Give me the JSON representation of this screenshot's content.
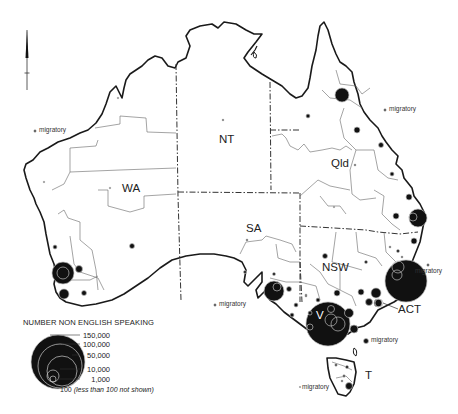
{
  "map": {
    "title": "Number of non English speaking (Australia)",
    "state_labels": [
      {
        "id": "wa",
        "label": "WA",
        "x": 122,
        "y": 183
      },
      {
        "id": "nt",
        "label": "NT",
        "x": 219,
        "y": 134
      },
      {
        "id": "qld",
        "label": "Qld",
        "x": 331,
        "y": 158
      },
      {
        "id": "sa",
        "label": "SA",
        "x": 246,
        "y": 223
      },
      {
        "id": "nsw",
        "label": "NSW",
        "x": 322,
        "y": 265
      },
      {
        "id": "vic",
        "label": "V",
        "x": 318,
        "y": 312
      },
      {
        "id": "act",
        "label": "ACT",
        "x": 398,
        "y": 309
      },
      {
        "id": "tas",
        "label": "T",
        "x": 365,
        "y": 374
      }
    ],
    "migratory_labels": [
      {
        "id": "mig-wa",
        "label": "migratory",
        "x": 38,
        "y": 128
      },
      {
        "id": "mig-qld",
        "label": "migratory",
        "x": 388,
        "y": 107
      },
      {
        "id": "mig-sa",
        "label": "migratory",
        "x": 220,
        "y": 302
      },
      {
        "id": "mig-nsw",
        "label": "migratory",
        "x": 417,
        "y": 266
      },
      {
        "id": "mig-vic",
        "label": "migratory",
        "x": 370,
        "y": 340
      },
      {
        "id": "mig-tas",
        "label": "migratory",
        "x": 302,
        "y": 385
      }
    ],
    "colors": {
      "coast": "#1a1a1a",
      "region_border": "#555555",
      "state_border": "#333333",
      "symbol_fill": "#111111",
      "symbol_ring": "#bbbbbb"
    }
  },
  "legend": {
    "title": "NUMBER NON ENGLISH SPEAKING",
    "values": [
      "150,000",
      "100,000",
      "50,000",
      "10,000",
      "1,000"
    ],
    "note_value": "100",
    "note_text": "(less than 100 not shown)"
  }
}
